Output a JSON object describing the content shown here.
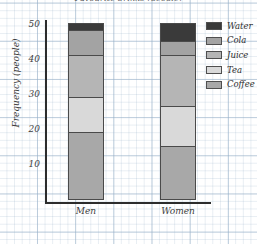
{
  "chart_data": {
    "type": "bar",
    "subtype": "stacked-bar",
    "title": "Favourite drinks (people)",
    "xlabel": "",
    "ylabel": "Frequency (people)",
    "categories": [
      "Men",
      "Women"
    ],
    "ylim": [
      0,
      50
    ],
    "yticks": [
      10,
      20,
      30,
      40,
      50
    ],
    "ytick_labels": [
      "10",
      "20",
      "30",
      "40",
      "50"
    ],
    "grid": true,
    "grid_style": "graph-paper",
    "legend_position": "right",
    "stack_order_bottom_to_top": [
      "Coffee",
      "Tea",
      "Juice",
      "Cola",
      "Water"
    ],
    "series": [
      {
        "name": "Coffee",
        "color": "#a8a8a8",
        "values": [
          19,
          15
        ]
      },
      {
        "name": "Tea",
        "color": "#d9d9d9",
        "values": [
          10,
          11.5
        ]
      },
      {
        "name": "Juice",
        "color": "#b5b5b5",
        "values": [
          12,
          14.5
        ]
      },
      {
        "name": "Cola",
        "color": "#a3a3a3",
        "values": [
          7,
          4
        ]
      },
      {
        "name": "Water",
        "color": "#3a3a3a",
        "values": [
          2,
          5
        ]
      }
    ],
    "cumulative_tops": {
      "Men": {
        "Coffee": 19,
        "Tea": 29,
        "Juice": 41,
        "Cola": 48,
        "Water": 50
      },
      "Women": {
        "Coffee": 15,
        "Tea": 26.5,
        "Juice": 41,
        "Cola": 45,
        "Water": 50
      }
    },
    "totals": [
      50,
      50
    ]
  },
  "legend": {
    "items": [
      {
        "label": "Water",
        "color": "#3a3a3a"
      },
      {
        "label": "Cola",
        "color": "#a3a3a3"
      },
      {
        "label": "Juice",
        "color": "#b5b5b5"
      },
      {
        "label": "Tea",
        "color": "#d9d9d9"
      },
      {
        "label": "Coffee",
        "color": "#a8a8a8"
      }
    ]
  },
  "axis": {
    "y_label": "Frequency (people)",
    "y_ticks": [
      "50",
      "40",
      "30",
      "20",
      "10"
    ],
    "x_labels": [
      "Men",
      "Women"
    ]
  }
}
